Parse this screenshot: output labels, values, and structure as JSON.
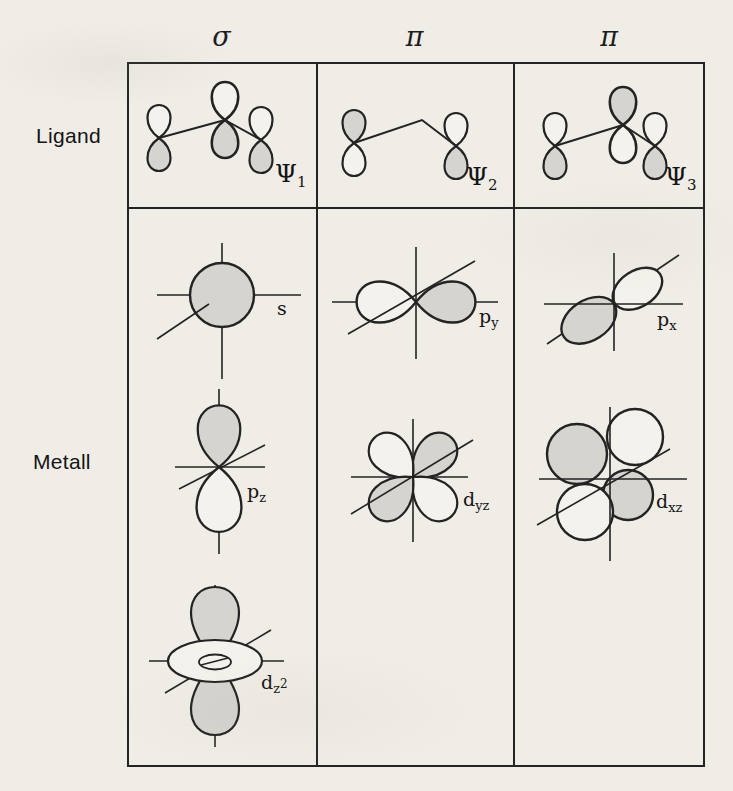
{
  "colors": {
    "paper": "#f0ede7",
    "lobe_gray": "#d6d4cf",
    "lobe_white": "#f4f2ec",
    "line": "#232323"
  },
  "headers": {
    "col1": "σ",
    "col2": "π",
    "col3": "π"
  },
  "row_labels": {
    "top": "Ligand",
    "bottom": "Metall"
  },
  "ligand_labels": {
    "psi1": {
      "base": "Ψ",
      "sub": "1"
    },
    "psi2": {
      "base": "Ψ",
      "sub": "2"
    },
    "psi3": {
      "base": "Ψ",
      "sub": "3"
    }
  },
  "metal_labels": {
    "s": {
      "base": "s"
    },
    "py": {
      "base": "p",
      "sub": "y"
    },
    "px": {
      "base": "p",
      "sub": "x"
    },
    "pz": {
      "base": "p",
      "sub": "z"
    },
    "dyz": {
      "base": "d",
      "sub": "yz"
    },
    "dxz": {
      "base": "d",
      "sub": "xz"
    },
    "dz2": {
      "base": "d",
      "sub": "z",
      "sup": "2"
    }
  }
}
